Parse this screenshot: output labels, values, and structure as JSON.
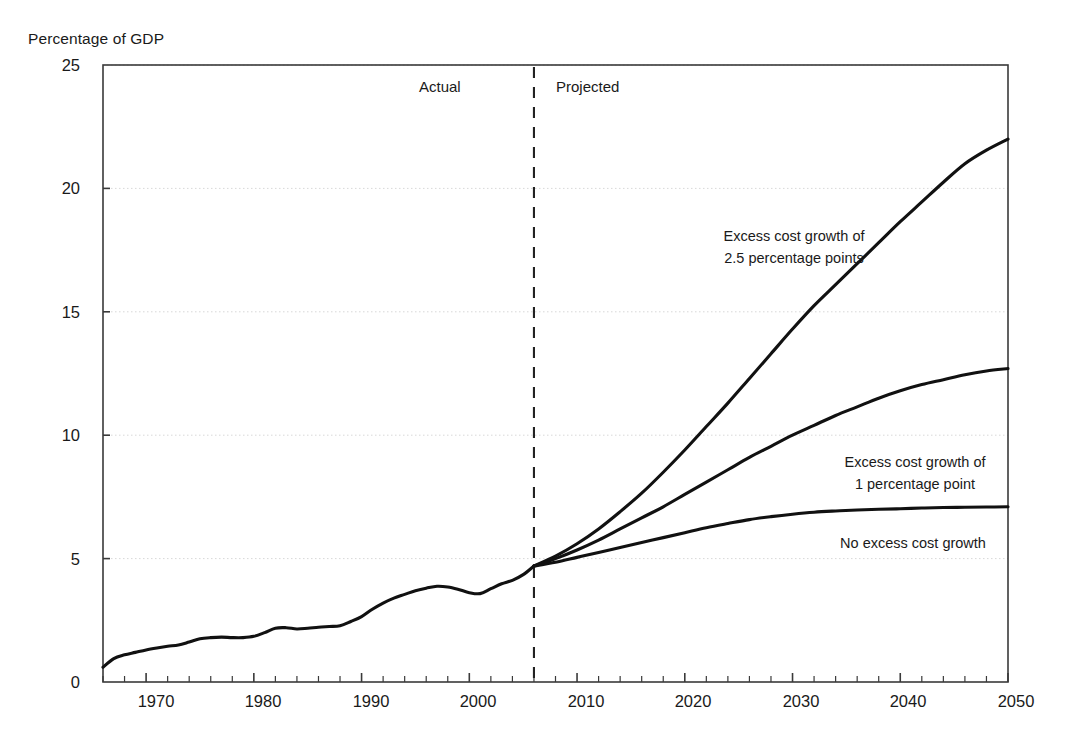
{
  "chart_data": {
    "type": "line",
    "title": "",
    "ylabel": "Percentage of GDP",
    "xlabel": "",
    "xlim": [
      1966,
      2050
    ],
    "ylim": [
      0,
      25
    ],
    "grid": "horizontal-dotted",
    "legend_position": "inline-annotations",
    "y_ticks": [
      0,
      5,
      10,
      15,
      20,
      25
    ],
    "y_tick_labels": [
      "0",
      "5",
      "10",
      "15",
      "20",
      "25"
    ],
    "x_ticks": [
      1970,
      1980,
      1990,
      2000,
      2010,
      2020,
      2030,
      2040,
      2050
    ],
    "x_tick_labels": [
      "1970",
      "1980",
      "1990",
      "2000",
      "2010",
      "2020",
      "2030",
      "2040",
      "2050"
    ],
    "x_minor_tick_interval": 2,
    "divider_year": 2006,
    "annotations": [
      {
        "text": "Actual",
        "x": 1996,
        "y": 23.4
      },
      {
        "text": "Projected",
        "x": 2014,
        "y": 23.4
      }
    ],
    "series": [
      {
        "name": "Historical",
        "segment": "actual",
        "x": [
          1966,
          1967,
          1968,
          1969,
          1970,
          1971,
          1972,
          1973,
          1974,
          1975,
          1976,
          1977,
          1978,
          1979,
          1980,
          1981,
          1982,
          1983,
          1984,
          1985,
          1986,
          1987,
          1988,
          1989,
          1990,
          1991,
          1992,
          1993,
          1994,
          1995,
          1996,
          1997,
          1998,
          1999,
          2000,
          2001,
          2002,
          2003,
          2004,
          2005,
          2006
        ],
        "y": [
          0.6,
          0.95,
          1.1,
          1.2,
          1.3,
          1.38,
          1.45,
          1.5,
          1.62,
          1.75,
          1.8,
          1.82,
          1.8,
          1.8,
          1.85,
          2.0,
          2.18,
          2.2,
          2.15,
          2.18,
          2.22,
          2.25,
          2.28,
          2.45,
          2.65,
          2.95,
          3.2,
          3.4,
          3.55,
          3.7,
          3.8,
          3.88,
          3.85,
          3.75,
          3.62,
          3.58,
          3.78,
          3.98,
          4.12,
          4.35,
          4.7
        ]
      },
      {
        "name": "Excess cost growth of 2.5 percentage points",
        "segment": "projected",
        "x": [
          2006,
          2008,
          2010,
          2012,
          2014,
          2016,
          2018,
          2020,
          2022,
          2024,
          2026,
          2028,
          2030,
          2032,
          2034,
          2036,
          2038,
          2040,
          2042,
          2044,
          2046,
          2048,
          2050
        ],
        "y": [
          4.7,
          5.1,
          5.6,
          6.2,
          6.9,
          7.65,
          8.5,
          9.4,
          10.35,
          11.3,
          12.3,
          13.3,
          14.3,
          15.25,
          16.1,
          16.95,
          17.8,
          18.65,
          19.45,
          20.25,
          21.0,
          21.55,
          22.0
        ]
      },
      {
        "name": "Excess cost growth of 1 percentage point",
        "segment": "projected",
        "x": [
          2006,
          2008,
          2010,
          2012,
          2014,
          2016,
          2018,
          2020,
          2022,
          2024,
          2026,
          2028,
          2030,
          2032,
          2034,
          2036,
          2038,
          2040,
          2042,
          2044,
          2046,
          2048,
          2050
        ],
        "y": [
          4.7,
          5.0,
          5.35,
          5.75,
          6.2,
          6.65,
          7.1,
          7.6,
          8.1,
          8.6,
          9.1,
          9.55,
          10.0,
          10.4,
          10.8,
          11.15,
          11.5,
          11.8,
          12.05,
          12.25,
          12.45,
          12.6,
          12.7
        ]
      },
      {
        "name": "No excess cost growth",
        "segment": "projected",
        "x": [
          2006,
          2008,
          2010,
          2012,
          2014,
          2016,
          2018,
          2020,
          2022,
          2024,
          2026,
          2028,
          2030,
          2032,
          2034,
          2036,
          2038,
          2040,
          2042,
          2044,
          2046,
          2048,
          2050
        ],
        "y": [
          4.7,
          4.85,
          5.05,
          5.25,
          5.45,
          5.65,
          5.85,
          6.05,
          6.25,
          6.42,
          6.58,
          6.7,
          6.8,
          6.88,
          6.93,
          6.97,
          7.0,
          7.02,
          7.05,
          7.07,
          7.08,
          7.09,
          7.1
        ]
      }
    ],
    "series_labels": [
      {
        "id": "label-excess-2-5",
        "line1": "Excess cost growth of",
        "line2": "2.5 percentage points"
      },
      {
        "id": "label-excess-1",
        "line1": "Excess cost growth of",
        "line2": "1 percentage point"
      },
      {
        "id": "label-no-excess",
        "line1": "No excess cost growth",
        "line2": ""
      }
    ],
    "colors": {
      "line": "#111111",
      "axis": "#3a3a3a",
      "grid": "#d8d8d8",
      "divider": "#222222",
      "background": "#ffffff"
    }
  }
}
